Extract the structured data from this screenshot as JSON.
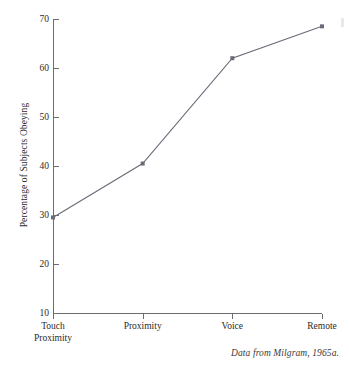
{
  "figure": {
    "caption": "Data from Milgram, 1965a."
  },
  "chart_data": {
    "type": "line",
    "title": "",
    "xlabel": "",
    "ylabel": "Percentage of Subjects Obeying",
    "categories": [
      "Touch Proximity",
      "Proximity",
      "Voice",
      "Remote"
    ],
    "category_lines": [
      [
        "Touch",
        "Proximity"
      ],
      [
        "Proximity"
      ],
      [
        "Voice"
      ],
      [
        "Remote"
      ]
    ],
    "values": [
      29.5,
      40.5,
      62.0,
      68.5
    ],
    "ylim": [
      10,
      70
    ],
    "yticks": [
      70,
      60,
      50,
      40,
      30,
      20,
      10
    ],
    "ytick_labels": [
      "70",
      "60",
      "50",
      "40",
      "30",
      "20",
      "10"
    ],
    "grid": false,
    "legend": false,
    "marker": "square",
    "series_color": "#6b6b78",
    "axis_color": "#6b6b72"
  }
}
